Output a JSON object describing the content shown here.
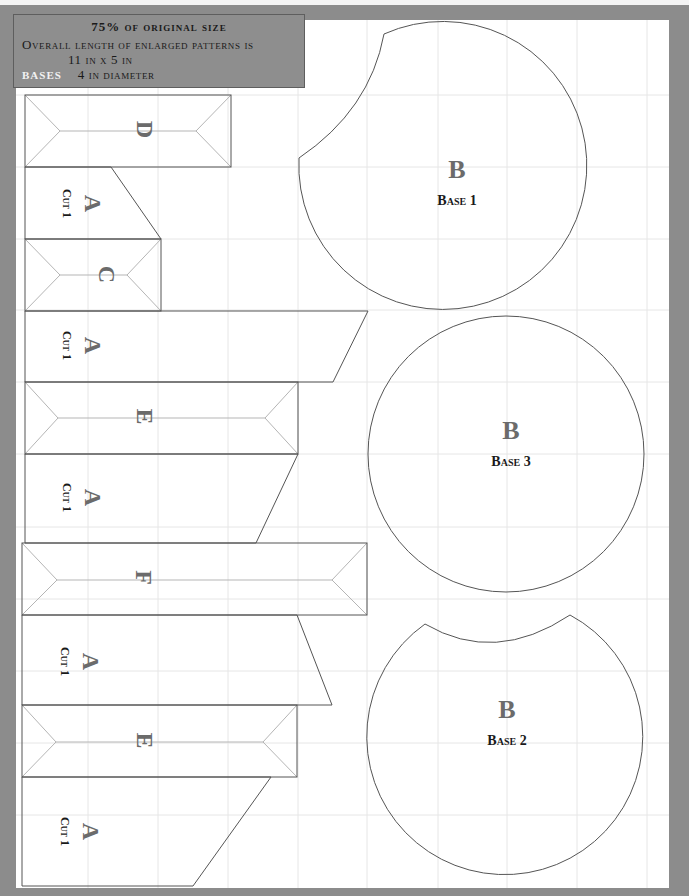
{
  "header": {
    "line1": "75% of original size",
    "line2": "Overall length of enlarged patterns is",
    "line3": "11 in x 5 in",
    "line4_label": "BASES",
    "line4_value": "4 in diameter"
  },
  "colors": {
    "frame": "#8c8c8c",
    "sheet": "#ffffff",
    "grid": "#e4e4e4",
    "outline": "#555555",
    "fold": "#b5b5b5",
    "piece_letter": "#6b6b6b",
    "cut_text": "#1a1a1a"
  },
  "pieces": {
    "D": {
      "letter": "D"
    },
    "A1": {
      "letter": "A",
      "cut": "Cut 1"
    },
    "C": {
      "letter": "C"
    },
    "A2": {
      "letter": "A",
      "cut": "Cut 1"
    },
    "E1": {
      "letter": "E"
    },
    "A3": {
      "letter": "A",
      "cut": "Cut 1"
    },
    "F": {
      "letter": "F"
    },
    "A4": {
      "letter": "A",
      "cut": "Cut 1"
    },
    "E2": {
      "letter": "E"
    },
    "A5": {
      "letter": "A",
      "cut": "Cut 1"
    }
  },
  "bases": [
    {
      "letter": "B",
      "label": "Base 1"
    },
    {
      "letter": "B",
      "label": "Base 3"
    },
    {
      "letter": "B",
      "label": "Base 2"
    }
  ]
}
